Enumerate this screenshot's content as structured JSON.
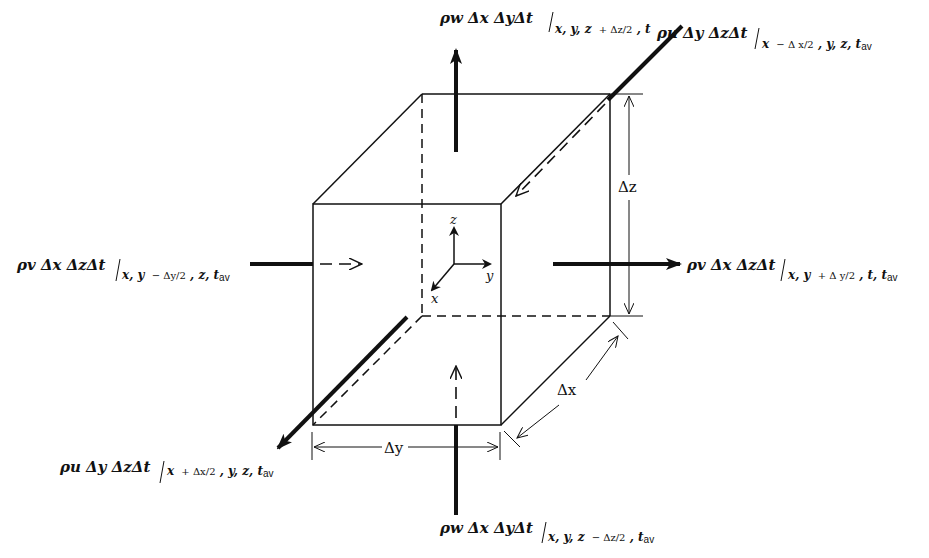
{
  "diagram": {
    "flux_labels": {
      "top": {
        "main": "ρw Δx ΔyΔt",
        "sub_vars": "x, y, z",
        "sub_delta": "+ Δz/2",
        "sub_time": ", t",
        "sub_av": ""
      },
      "back": {
        "main": "ρu Δy ΔzΔt",
        "sub_vars": "x",
        "sub_delta": "− Δ x/2",
        "sub_time": ", y, z, t",
        "sub_av": "av"
      },
      "left": {
        "main": "ρv Δx ΔzΔt",
        "sub_vars": "x, y",
        "sub_delta": "− Δy/2",
        "sub_time": ", z, t",
        "sub_av": "av"
      },
      "right": {
        "main": "ρv Δx ΔzΔt",
        "sub_vars": "x, y",
        "sub_delta": "+ Δ y/2",
        "sub_time": ", t, t",
        "sub_av": "av"
      },
      "front": {
        "main": "ρu Δy ΔzΔt",
        "sub_vars": "x",
        "sub_delta": "+ Δx/2",
        "sub_time": ", y, z, t",
        "sub_av": "av"
      },
      "bottom": {
        "main": "ρw Δx ΔyΔt",
        "sub_vars": "x, y, z",
        "sub_delta": "− Δz/2",
        "sub_time": ", t",
        "sub_av": "av"
      }
    },
    "dimensions": {
      "dx": "Δx",
      "dy": "Δy",
      "dz": "Δz"
    },
    "axes": {
      "x": "x",
      "y": "y",
      "z": "z"
    },
    "colors": {
      "ink": "#111111",
      "background": "#ffffff"
    }
  }
}
